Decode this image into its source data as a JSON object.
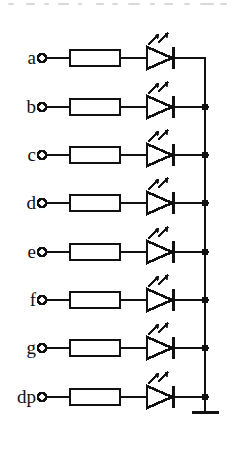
{
  "diagram": {
    "line_color": "#111111",
    "background_color": "#ffffff",
    "segment_count": 8,
    "common_terminal": "ground",
    "rows": [
      {
        "label": "a",
        "y": 58,
        "bus_junction": "corner"
      },
      {
        "label": "b",
        "y": 107,
        "bus_junction": "dot"
      },
      {
        "label": "c",
        "y": 155,
        "bus_junction": "dot"
      },
      {
        "label": "d",
        "y": 203,
        "bus_junction": "dot"
      },
      {
        "label": "e",
        "y": 252,
        "bus_junction": "dot"
      },
      {
        "label": "f",
        "y": 300,
        "bus_junction": "dot"
      },
      {
        "label": "g",
        "y": 348,
        "bus_junction": "dot"
      },
      {
        "label": "dp",
        "y": 397,
        "bus_junction": "dot"
      }
    ],
    "geometry": {
      "label_right_x": 36,
      "terminal_cx": 42,
      "terminal_r": 4,
      "resistor_x1": 70,
      "resistor_x2": 120,
      "resistor_half_height": 8,
      "diode_tip_x": 172,
      "diode_back_x": 147,
      "diode_half_height": 11,
      "cathode_x": 173,
      "bus_x": 205,
      "ground_y": 412,
      "ground_bar_x1": 192,
      "ground_bar_x2": 219
    },
    "components": {
      "terminal_name": "input-terminal",
      "resistor_name": "series-resistor",
      "led_name": "light-emitting-diode",
      "bus_name": "common-bus",
      "ground_name": "ground-symbol"
    },
    "scan_artifacts": [
      {
        "x": 8,
        "w": 6
      },
      {
        "x": 26,
        "w": 9
      },
      {
        "x": 44,
        "w": 5
      },
      {
        "x": 58,
        "w": 11
      },
      {
        "x": 78,
        "w": 4
      },
      {
        "x": 96,
        "w": 8
      },
      {
        "x": 112,
        "w": 6
      },
      {
        "x": 128,
        "w": 12
      },
      {
        "x": 150,
        "w": 5
      },
      {
        "x": 164,
        "w": 9
      },
      {
        "x": 184,
        "w": 6
      },
      {
        "x": 200,
        "w": 14
      },
      {
        "x": 220,
        "w": 7
      }
    ]
  }
}
